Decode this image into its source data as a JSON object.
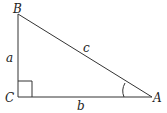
{
  "diagram": {
    "vertices": {
      "A": {
        "label": "A",
        "x": 152,
        "y": 97
      },
      "B": {
        "label": "B",
        "x": 18,
        "y": 14
      },
      "C": {
        "label": "C",
        "x": 18,
        "y": 97
      }
    },
    "sides": {
      "a": {
        "label": "a",
        "between": [
          "B",
          "C"
        ]
      },
      "b": {
        "label": "b",
        "between": [
          "C",
          "A"
        ]
      },
      "c": {
        "label": "c",
        "between": [
          "B",
          "A"
        ]
      }
    },
    "right_angle_at": "C",
    "marked_angle_at": "A",
    "colors": {
      "stroke": "#333333",
      "text": "#222222",
      "background": "#ffffff"
    }
  }
}
